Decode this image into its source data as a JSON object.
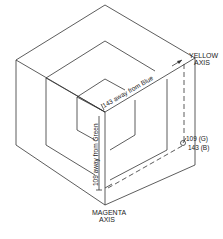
{
  "diagram": {
    "type": "isometric color cube (CMY axes) with nested cubes",
    "labels": {
      "yellow_axis_line1": "YELLOW",
      "yellow_axis_line2": "AXIS",
      "magenta_axis_line1": "MAGENTA",
      "magenta_axis_line2": "AXIS",
      "dim_blue": "143 away from Blue",
      "dim_green": "109 away from Green",
      "point_g": "109 (G)",
      "point_b": "143 (B)"
    },
    "colors": {
      "line": "#333333",
      "text": "#222222",
      "background": "#ffffff"
    }
  }
}
